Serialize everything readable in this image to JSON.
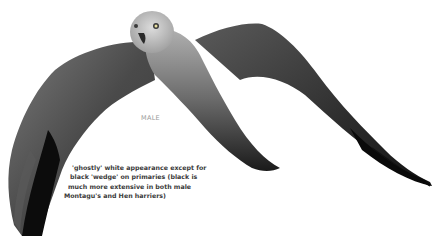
{
  "illustration": {
    "subject": "harrier-in-flight",
    "sex_label": "MALE",
    "caption_lines": [
      "'ghostly' white appearance except for",
      "black 'wedge' on primaries (black is",
      "much more extensive in both male",
      "Montagu's and Hen harriers)"
    ],
    "caption_indents": [
      8,
      6,
      4,
      0
    ]
  },
  "colors": {
    "background": "#ffffff",
    "head": "#c8c8c8",
    "wing_grey": "#5a5a5a",
    "wing_dark": "#2a2a2a",
    "wingtip_black": "#0c0c0c",
    "label_grey": "#9a9a9a",
    "caption_text": "#3a3a3a"
  }
}
